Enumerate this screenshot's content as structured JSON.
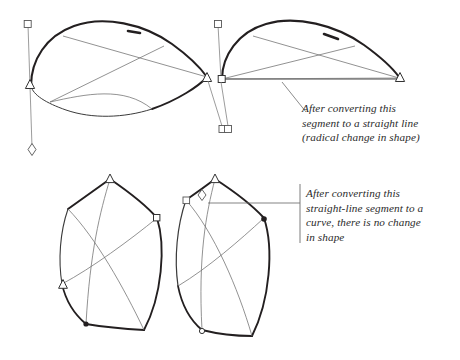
{
  "figure": {
    "name": "bezier-segment-conversion-illustration",
    "background_color": "#ffffff",
    "ink_color": "#231f20",
    "thin_line_color": "#6d6d6d",
    "text_color": "#2b2b2b"
  },
  "captions": {
    "callout_1": {
      "text": "After converting this\nsegment to a straight line\n(radical change in shape)",
      "lines": [
        "After converting this",
        "segment to a straight line",
        "(radical change in shape)"
      ]
    },
    "callout_2": {
      "text": "After converting this\nstraight-line segment to a\ncurve, there is no change\nin shape",
      "lines": [
        "After converting this",
        "straight-line segment to a",
        "curve, there is no change",
        "in shape"
      ]
    }
  },
  "shapes": {
    "top_left": {
      "label": "leaf-shape-original-curved-bottom",
      "outline": "M 31,84 C 33,56 52,30 86,24 C 122,18 160,34 186,56 C 200,68 205,74 206,78 C 196,92 170,108 140,116 C 108,124 74,120 52,108 C 38,100 32,92 31,84 Z",
      "bottom_segment_style": "curve"
    },
    "top_right": {
      "label": "leaf-shape-converted-straight-bottom",
      "outline": "M 222,78 C 224,50 243,28 277,24 C 313,20 351,34 378,56 C 392,68 398,74 400,78 L 222,78 Z",
      "bottom_segment_style": "straight-line"
    },
    "bottom_left": {
      "label": "quad-shape-original-straight-top-left",
      "outline": "M 115,178 L 73,208 C 60,246 62,282 86,318 L 146,330 C 166,298 170,250 160,220 Z",
      "top_left_segment_style": "straight-line"
    },
    "bottom_right": {
      "label": "quad-shape-converted-curved-top-left",
      "outline": "M 215,178 L 190,198 C 176,238 178,282 200,326 L 252,334 C 272,300 276,252 266,220 Z",
      "top_left_segment_style": "curve"
    }
  },
  "handles": {
    "square": "bezier-control-handle-square",
    "triangle": "bezier-anchor-point-triangle",
    "diamond": "bezier-control-handle-diamond",
    "dot": "bezier-anchor-point-dot"
  },
  "leaders": {
    "callout_1_leader": "diagonal-leader-line",
    "callout_2_leader": "bracket-leader-line"
  }
}
